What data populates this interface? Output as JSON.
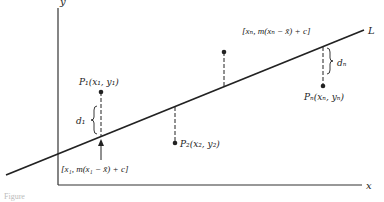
{
  "diagram": {
    "type": "least-squares-regression-line",
    "axes": {
      "x_label": "x",
      "y_label": "y"
    },
    "line": {
      "label": "L"
    },
    "points": [
      {
        "name": "P1",
        "label": "P₁(x₁, y₁)",
        "position": "above-line",
        "deviation_label": "d₁"
      },
      {
        "name": "P2",
        "label": "P₂(x₂, y₂)",
        "position": "below-line"
      },
      {
        "name": "P3",
        "label": "",
        "position": "above-line"
      },
      {
        "name": "Pn",
        "label": "Pₙ(xₙ, yₙ)",
        "position": "below-line",
        "deviation_label": "dₙ"
      }
    ],
    "annotations": {
      "line_point_1": "[x₁, m(x₁ − x̄) + c]",
      "line_point_n": "[xₙ, m(xₙ − x̄) + c]"
    },
    "caption": "Figure"
  },
  "colors": {
    "ink": "#222222",
    "background": "#ffffff"
  }
}
